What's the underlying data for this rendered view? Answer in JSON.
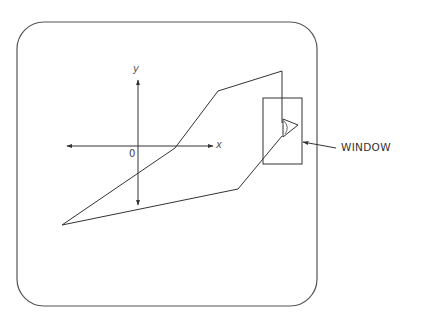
{
  "diagram": {
    "labels": {
      "x_axis": "x",
      "y_axis": "y",
      "origin": "0",
      "window": "WINDOW"
    },
    "colors": {
      "stroke": "#333333",
      "background": "#ffffff"
    }
  }
}
